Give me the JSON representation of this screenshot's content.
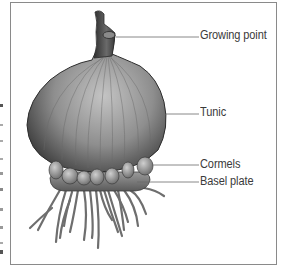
{
  "diagram": {
    "labels": [
      {
        "id": "growing_point",
        "text": "Growing point"
      },
      {
        "id": "tunic",
        "text": "Tunic"
      },
      {
        "id": "cormels",
        "text": "Cormels"
      },
      {
        "id": "basal_plate",
        "text": "Basel plate"
      }
    ]
  },
  "colors": {
    "frame": "#8a8a8a",
    "label_text": "#3a3a3a",
    "leader_line": "#6a6a6a",
    "bulb_dark": "#3c3c3c",
    "bulb_light": "#b8b8b8",
    "roots": "#6e6e6e"
  }
}
